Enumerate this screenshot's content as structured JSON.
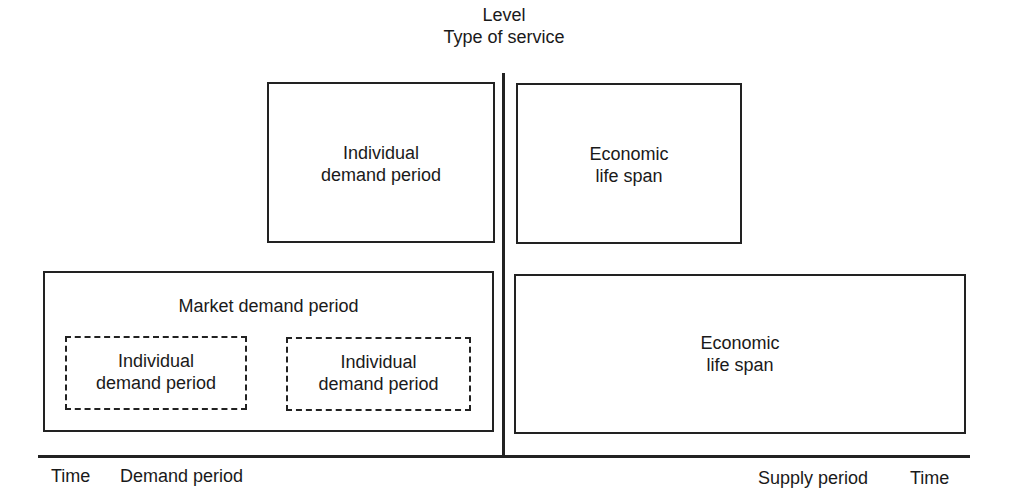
{
  "diagram": {
    "vertical_axis": {
      "label_line1": "Level",
      "label_line2": "Type of service"
    },
    "horizontal_axis": {
      "left": {
        "time_label": "Time",
        "period_label": "Demand period"
      },
      "right": {
        "period_label": "Supply period",
        "time_label": "Time"
      }
    },
    "upper_left_box": {
      "line1": "Individual",
      "line2": "demand period"
    },
    "upper_right_box": {
      "line1": "Economic",
      "line2": "life span"
    },
    "lower_left_box": {
      "title": "Market demand period",
      "sub_boxes": [
        {
          "line1": "Individual",
          "line2": "demand period"
        },
        {
          "line1": "Individual",
          "line2": "demand period"
        }
      ]
    },
    "lower_right_box": {
      "line1": "Economic",
      "line2": "life span"
    }
  }
}
